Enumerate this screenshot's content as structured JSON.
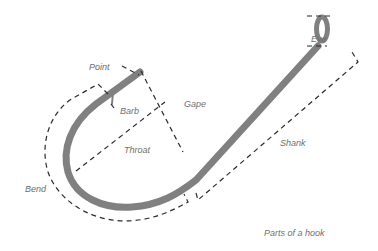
{
  "diagram": {
    "title": "Parts of a hook",
    "colors": {
      "hook": "#808080",
      "dash": "#2a2a2a",
      "label": "#6e6e6e",
      "background": "#ffffff"
    },
    "labels": {
      "point": "Point",
      "barb": "Barb",
      "gape": "Gape",
      "throat": "Throat",
      "bend": "Bend",
      "shank": "Shank",
      "eye": "Eye"
    },
    "caption": "Parts of a hook"
  }
}
